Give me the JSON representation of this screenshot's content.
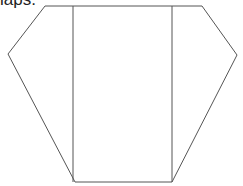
{
  "caption": {
    "text": "laps."
  },
  "diagram": {
    "stroke_color": "#555555",
    "outline_points": "45,6 202,6 237,55 172,182 75,182 8,54",
    "left_fold_line": {
      "x1": 73,
      "y1": 6,
      "x2": 73,
      "y2": 182
    },
    "right_fold_line": {
      "x1": 172,
      "y1": 6,
      "x2": 172,
      "y2": 182
    }
  }
}
